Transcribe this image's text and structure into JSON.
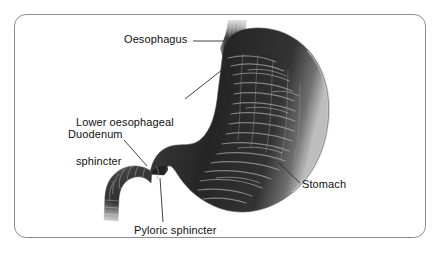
{
  "figure": {
    "kind": "anatomical-diagram",
    "border_color": "#8c8c8c",
    "background_color": "#ffffff",
    "label_color": "#101010"
  },
  "labels": {
    "oesophagus": "Oesophagus",
    "lower_oesophageal_sphincter_line1": "Lower oesophageal",
    "lower_oesophageal_sphincter_line2": "sphincter",
    "duodenum": "Duodenum",
    "stomach": "Stomach",
    "pyloric_sphincter": "Pyloric sphincter"
  },
  "structures": [
    {
      "name": "oesophagus",
      "label": "Oesophagus",
      "description": "Vertical muscular tube entering the stomach at the top, fading out at the upper edge"
    },
    {
      "name": "lower-oesophageal-sphincter",
      "label": "Lower oesophageal sphincter",
      "description": "Narrowed junction where the oesophagus meets the cardia of the stomach"
    },
    {
      "name": "stomach",
      "label": "Stomach",
      "description": "Large J-shaped organ with internal rugae folds, lesser curvature on the left and greater curvature on the right"
    },
    {
      "name": "pyloric-sphincter",
      "label": "Pyloric sphincter",
      "description": "Constricted ring at the stomach outlet leading into the duodenum"
    },
    {
      "name": "duodenum",
      "label": "Duodenum",
      "description": "Curved first segment of the small intestine descending to the left, fading at its cut end"
    }
  ],
  "colors": {
    "organ_dark": "#2a2a2a",
    "organ_mid": "#565656",
    "organ_light": "#b4b4b4",
    "rugae_highlight": "#cfcfcf",
    "leader_line": "#2b2b2b"
  }
}
